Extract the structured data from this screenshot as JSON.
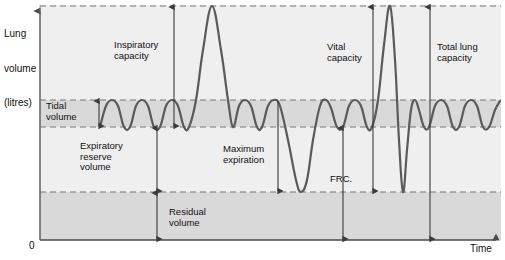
{
  "figure": {
    "type": "spirogram",
    "axes": {
      "y_label": "Lung\nvolume\n(litres)",
      "y_label_lines": [
        "Lung",
        "volume",
        "(litres)"
      ],
      "x_label": "Time",
      "origin_label": "0",
      "y_axis_arrow": "up",
      "x_axis_arrow": "right"
    },
    "colors": {
      "trace": "#5a5a5a",
      "band_fill": "#d9d9d9",
      "plot_fill": "#efefef",
      "axis": "#4a4a4a",
      "dashed": "#777777",
      "text": "#111111",
      "background": "#ffffff"
    },
    "levels": {
      "total_lung_capacity_line": {
        "name": "maximum inspiration level",
        "y": 6,
        "style": "dashed"
      },
      "tidal_peak_line": {
        "name": "end tidal inspiration",
        "y": 100,
        "style": "dashed"
      },
      "tidal_trough_line": {
        "name": "end tidal expiration (FRC level)",
        "y": 127,
        "style": "dashed"
      },
      "residual_line": {
        "name": "maximum expiration level",
        "y": 192,
        "style": "dashed"
      },
      "baseline": {
        "name": "zero volume",
        "y": 240,
        "style": "solid"
      }
    },
    "shaded_bands": [
      {
        "name": "tidal-volume-band",
        "from": 100,
        "to": 127
      },
      {
        "name": "residual-volume-band",
        "from": 192,
        "to": 240
      }
    ],
    "annotations": [
      {
        "id": "tidal-volume",
        "label": "Tidal\nvolume",
        "lines": [
          "Tidal",
          "volume"
        ],
        "arrow": "double",
        "x": 99,
        "y_top": 100,
        "y_bottom": 127,
        "text_x": 46,
        "text_y": 101,
        "align": "left"
      },
      {
        "id": "inspiratory-capacity",
        "label": "Inspiratory\ncapacity",
        "lines": [
          "Inspiratory",
          "capacity"
        ],
        "arrow": "double",
        "x": 174,
        "y_top": 6,
        "y_bottom": 127,
        "text_x": 114,
        "text_y": 40,
        "align": "left"
      },
      {
        "id": "expiratory-reserve-volume",
        "label": "Expiratory\nreserve\nvolume",
        "lines": [
          "Expiratory",
          "reserve",
          "volume"
        ],
        "arrow": "double",
        "x": 157,
        "y_top": 127,
        "y_bottom": 192,
        "text_x": 80,
        "text_y": 141,
        "align": "left"
      },
      {
        "id": "residual-volume",
        "label": "Residual\nvolume",
        "lines": [
          "Residual",
          "volume"
        ],
        "arrow": "double",
        "x": 157,
        "y_top": 192,
        "y_bottom": 240,
        "text_x": 169,
        "text_y": 207,
        "align": "left"
      },
      {
        "id": "maximum-expiration",
        "label": "Maximum\nexpiration",
        "lines": [
          "Maximum",
          "expiration"
        ],
        "arrow": "single-down",
        "x": 278,
        "y_top": 100,
        "y_bottom": 192,
        "text_x": 223,
        "text_y": 144,
        "align": "left"
      },
      {
        "id": "frc",
        "label": "FRC.",
        "lines": [
          "FRC."
        ],
        "arrow": "double",
        "x": 343,
        "y_top": 127,
        "y_bottom": 240,
        "text_x": 330,
        "text_y": 174,
        "align": "left"
      },
      {
        "id": "vital-capacity",
        "label": "Vital\ncapacity",
        "lines": [
          "Vital",
          "capacity"
        ],
        "arrow": "double",
        "x": 373,
        "y_top": 6,
        "y_bottom": 192,
        "text_x": 327,
        "text_y": 42,
        "align": "left"
      },
      {
        "id": "total-lung-capacity",
        "label": "Total lung\ncapacity",
        "lines": [
          "Total lung",
          "capacity"
        ],
        "arrow": "double",
        "x": 430,
        "y_top": 6,
        "y_bottom": 240,
        "text_x": 437,
        "text_y": 42,
        "align": "left"
      }
    ]
  },
  "chart_data": {
    "type": "line",
    "xlabel": "Time",
    "ylabel": "Lung volume (litres)",
    "grid": false,
    "legend": null,
    "xlim": [
      0,
      505
    ],
    "ylim_pixels": [
      240,
      6
    ],
    "level_values": {
      "total_lung_capacity": 6,
      "tidal_peak": 100,
      "tidal_trough": 127,
      "residual": 192,
      "zero": 240
    },
    "series": [
      {
        "name": "spirogram trace",
        "description": "Tidal breathing interrupted by a maximal inspiration, a maximal expiration, then a vital-capacity manoeuvre",
        "points_px": [
          [
            100,
            127
          ],
          [
            106,
            106
          ],
          [
            112,
            100
          ],
          [
            118,
            106
          ],
          [
            124,
            127
          ],
          [
            130,
            127
          ],
          [
            136,
            106
          ],
          [
            142,
            100
          ],
          [
            148,
            106
          ],
          [
            154,
            127
          ],
          [
            160,
            127
          ],
          [
            166,
            106
          ],
          [
            172,
            100
          ],
          [
            178,
            106
          ],
          [
            184,
            127
          ],
          [
            189,
            127
          ],
          [
            196,
            100
          ],
          [
            203,
            50
          ],
          [
            212,
            6
          ],
          [
            221,
            50
          ],
          [
            228,
            100
          ],
          [
            233,
            127
          ],
          [
            239,
            106
          ],
          [
            245,
            100
          ],
          [
            251,
            106
          ],
          [
            257,
            127
          ],
          [
            262,
            127
          ],
          [
            268,
            106
          ],
          [
            274,
            100
          ],
          [
            280,
            106
          ],
          [
            288,
            140
          ],
          [
            296,
            180
          ],
          [
            301,
            192
          ],
          [
            307,
            180
          ],
          [
            313,
            140
          ],
          [
            320,
            106
          ],
          [
            326,
            100
          ],
          [
            331,
            108
          ],
          [
            337,
            127
          ],
          [
            343,
            127
          ],
          [
            349,
            106
          ],
          [
            355,
            100
          ],
          [
            361,
            106
          ],
          [
            367,
            127
          ],
          [
            372,
            127
          ],
          [
            378,
            100
          ],
          [
            384,
            45
          ],
          [
            390,
            6
          ],
          [
            395,
            60
          ],
          [
            399,
            140
          ],
          [
            403,
            192
          ],
          [
            407,
            150
          ],
          [
            411,
            110
          ],
          [
            415,
            100
          ],
          [
            419,
            110
          ],
          [
            424,
            127
          ],
          [
            429,
            127
          ],
          [
            435,
            106
          ],
          [
            441,
            100
          ],
          [
            447,
            106
          ],
          [
            453,
            127
          ],
          [
            459,
            127
          ],
          [
            465,
            106
          ],
          [
            471,
            100
          ],
          [
            477,
            106
          ],
          [
            483,
            127
          ],
          [
            489,
            127
          ],
          [
            495,
            110
          ],
          [
            500,
            101
          ]
        ]
      }
    ],
    "annotated_quantities": [
      {
        "label": "Tidal volume",
        "span_px": [
          100,
          127
        ]
      },
      {
        "label": "Inspiratory capacity",
        "span_px": [
          6,
          127
        ]
      },
      {
        "label": "Expiratory reserve volume",
        "span_px": [
          127,
          192
        ]
      },
      {
        "label": "Residual volume",
        "span_px": [
          192,
          240
        ]
      },
      {
        "label": "Maximum expiration",
        "span_px": [
          100,
          192
        ]
      },
      {
        "label": "FRC.",
        "span_px": [
          127,
          240
        ]
      },
      {
        "label": "Vital capacity",
        "span_px": [
          6,
          192
        ]
      },
      {
        "label": "Total lung capacity",
        "span_px": [
          6,
          240
        ]
      }
    ]
  }
}
